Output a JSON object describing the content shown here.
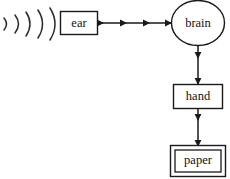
{
  "diagram": {
    "background_color": "#ffffff",
    "line_color": "#1a1a1a",
    "text_color": "#111111",
    "nodes": [
      {
        "id": "ear",
        "label": "ear",
        "shape": "rectangle",
        "border": "single",
        "x": 60,
        "y": 11,
        "width": 38,
        "height": 24
      },
      {
        "id": "brain",
        "label": "brain",
        "shape": "ellipse",
        "border": "single",
        "cx": 198,
        "cy": 23,
        "rx": 27,
        "ry": 23
      },
      {
        "id": "hand",
        "label": "hand",
        "shape": "rectangle",
        "border": "single",
        "x": 173,
        "y": 84,
        "width": 50,
        "height": 25
      },
      {
        "id": "paper",
        "label": "paper",
        "shape": "rectangle",
        "border": "double",
        "x": 170,
        "y": 145,
        "width": 56,
        "height": 32
      }
    ],
    "edges": [
      {
        "id": "ear-to-brain",
        "from": "ear",
        "to": "brain",
        "direction": "right",
        "arrowhead_count": 4
      },
      {
        "id": "brain-to-hand",
        "from": "brain",
        "to": "hand",
        "direction": "down",
        "arrowhead_count": 2
      },
      {
        "id": "hand-to-paper",
        "from": "hand",
        "to": "paper",
        "direction": "down",
        "arrowhead_count": 2
      }
    ],
    "sound_waves": {
      "id": "sound-waves",
      "description": "five nested arcs representing incoming sound",
      "arc_count": 5,
      "color": "#2b2b2b"
    }
  }
}
